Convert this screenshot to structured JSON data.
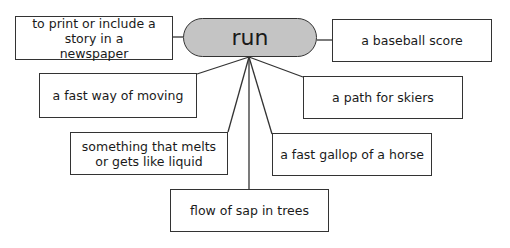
{
  "center": {
    "word": "run",
    "fill": "#c4c4c4"
  },
  "meanings": [
    {
      "id": "newspaper",
      "text": "to print or include a story in a newspaper",
      "x": 15,
      "y": 16,
      "w": 158,
      "h": 44
    },
    {
      "id": "baseball",
      "text": "a baseball score",
      "x": 332,
      "y": 19,
      "w": 160,
      "h": 43
    },
    {
      "id": "moving",
      "text": "a fast way of moving",
      "x": 39,
      "y": 73,
      "w": 158,
      "h": 45
    },
    {
      "id": "skiers",
      "text": "a path for skiers",
      "x": 303,
      "y": 76,
      "w": 160,
      "h": 43
    },
    {
      "id": "melts",
      "text": "something that melts or gets like liquid",
      "x": 70,
      "y": 132,
      "w": 158,
      "h": 43
    },
    {
      "id": "horse",
      "text": "a fast gallop of a horse",
      "x": 272,
      "y": 133,
      "w": 160,
      "h": 43
    },
    {
      "id": "sap",
      "text": "flow of sap in trees",
      "x": 170,
      "y": 189,
      "w": 159,
      "h": 43
    }
  ]
}
